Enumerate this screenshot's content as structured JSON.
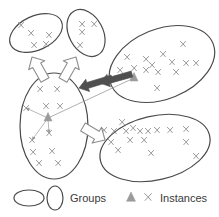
{
  "figure": {
    "background": "#ffffff",
    "stroke_dark": "#4a4a4a",
    "stroke_gray": "#9a9a9a",
    "arrow_solid_fill": "#4f4f4f",
    "arrow_hollow_fill": "#ffffff",
    "arrow_hollow_stroke": "#8e8e8e",
    "instance_marker_color": "#8c8c8c",
    "triangle_color": "#9b9b9b"
  },
  "groups": [
    {
      "id": "group-top-left",
      "name": "top-left-group",
      "cx": 36,
      "cy": 33,
      "rx": 28,
      "ry": 17,
      "rotate": -25,
      "instances": [
        {
          "x": 21,
          "y": 25
        },
        {
          "x": 31,
          "y": 33
        },
        {
          "x": 34,
          "y": 45
        },
        {
          "x": 46,
          "y": 44
        },
        {
          "x": 49,
          "y": 35
        }
      ]
    },
    {
      "id": "group-top-right",
      "name": "top-right-group",
      "cx": 86,
      "cy": 33,
      "rx": 25,
      "ry": 17,
      "rotate": 62,
      "instances": [
        {
          "x": 82,
          "y": 24
        },
        {
          "x": 94,
          "y": 24
        },
        {
          "x": 82,
          "y": 32
        },
        {
          "x": 80,
          "y": 45
        }
      ]
    },
    {
      "id": "group-center-left",
      "name": "center-left-group",
      "cx": 54,
      "cy": 126,
      "rx": 34,
      "ry": 53,
      "rotate": 0,
      "centroid": {
        "x": 48,
        "y": 118
      },
      "instances": [
        {
          "x": 40,
          "y": 89
        },
        {
          "x": 57,
          "y": 89
        },
        {
          "x": 26,
          "y": 108
        },
        {
          "x": 46,
          "y": 106
        },
        {
          "x": 60,
          "y": 106
        },
        {
          "x": 49,
          "y": 133
        },
        {
          "x": 32,
          "y": 140
        },
        {
          "x": 33,
          "y": 152
        },
        {
          "x": 52,
          "y": 151
        },
        {
          "x": 39,
          "y": 163
        },
        {
          "x": 58,
          "y": 163
        }
      ],
      "centroid_links": [
        {
          "x": 26,
          "y": 108
        },
        {
          "x": 32,
          "y": 140
        },
        {
          "x": 49,
          "y": 133
        }
      ]
    },
    {
      "id": "group-right-large",
      "name": "right-large-group",
      "cx": 162,
      "cy": 64,
      "rx": 55,
      "ry": 35,
      "rotate": -22,
      "centroid": {
        "x": 134,
        "y": 78
      },
      "instances": [
        {
          "x": 183,
          "y": 44
        },
        {
          "x": 127,
          "y": 57
        },
        {
          "x": 146,
          "y": 59
        },
        {
          "x": 163,
          "y": 54
        },
        {
          "x": 152,
          "y": 65
        },
        {
          "x": 172,
          "y": 62
        },
        {
          "x": 186,
          "y": 63
        },
        {
          "x": 196,
          "y": 63
        },
        {
          "x": 120,
          "y": 70
        },
        {
          "x": 134,
          "y": 68
        },
        {
          "x": 146,
          "y": 70
        },
        {
          "x": 158,
          "y": 72
        },
        {
          "x": 176,
          "y": 72
        },
        {
          "x": 113,
          "y": 78
        },
        {
          "x": 157,
          "y": 88
        }
      ]
    },
    {
      "id": "group-bottom-right",
      "name": "bottom-right-group",
      "cx": 155,
      "cy": 148,
      "rx": 56,
      "ry": 32,
      "rotate": -13,
      "instances": [
        {
          "x": 122,
          "y": 122
        },
        {
          "x": 104,
          "y": 130
        },
        {
          "x": 114,
          "y": 131
        },
        {
          "x": 126,
          "y": 131
        },
        {
          "x": 133,
          "y": 128
        },
        {
          "x": 140,
          "y": 131
        },
        {
          "x": 148,
          "y": 131
        },
        {
          "x": 157,
          "y": 130
        },
        {
          "x": 170,
          "y": 130
        },
        {
          "x": 186,
          "y": 129
        },
        {
          "x": 130,
          "y": 140
        },
        {
          "x": 144,
          "y": 140
        },
        {
          "x": 111,
          "y": 142
        },
        {
          "x": 186,
          "y": 142
        },
        {
          "x": 118,
          "y": 150
        },
        {
          "x": 151,
          "y": 153
        },
        {
          "x": 196,
          "y": 156
        }
      ]
    }
  ],
  "arrows": {
    "hollow": [
      {
        "name": "arrow-to-top-left-group",
        "from": {
          "x": 45,
          "y": 80
        },
        "to": {
          "x": 32,
          "y": 57
        }
      },
      {
        "name": "arrow-to-top-right-group",
        "from": {
          "x": 63,
          "y": 80
        },
        "to": {
          "x": 76,
          "y": 57
        }
      },
      {
        "name": "arrow-to-bottom-right-group",
        "from": {
          "x": 83,
          "y": 127
        },
        "to": {
          "x": 105,
          "y": 140
        }
      }
    ],
    "solid": [
      {
        "name": "arrow-right-to-center-upper",
        "from": {
          "x": 112,
          "y": 78
        },
        "to": {
          "x": 79,
          "y": 88
        }
      },
      {
        "name": "arrow-right-to-center-lower",
        "from": {
          "x": 132,
          "y": 74
        },
        "to": {
          "x": 100,
          "y": 83
        }
      }
    ],
    "thin_gray": [
      {
        "name": "centroid-distance-line",
        "from": {
          "x": 48,
          "y": 118
        },
        "to": {
          "x": 134,
          "y": 78
        }
      }
    ]
  },
  "legend": {
    "items": [
      {
        "id": "legend-groups",
        "label": "Groups",
        "symbols": [
          "ellipse-horizontal",
          "ellipse-vertical"
        ]
      },
      {
        "id": "legend-instances",
        "label": "Instances",
        "symbols": [
          "triangle-marker",
          "x-marker"
        ]
      }
    ]
  }
}
